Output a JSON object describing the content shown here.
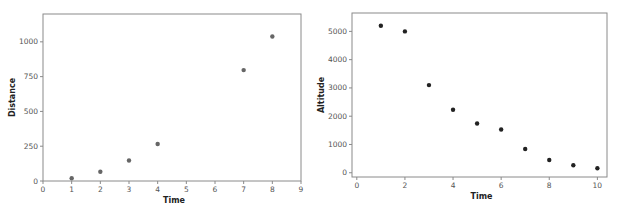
{
  "chart_data": [
    {
      "type": "scatter",
      "title": "",
      "xlabel": "Time",
      "ylabel": "Distance",
      "xlim": [
        0,
        9
      ],
      "ylim": [
        0,
        1200
      ],
      "xticks": [
        0,
        1,
        2,
        3,
        4,
        5,
        6,
        7,
        8,
        9
      ],
      "yticks": [
        0,
        250,
        500,
        750,
        1000
      ],
      "grid": false,
      "marker_color": "#666666",
      "series": [
        {
          "name": "Distance",
          "x": [
            1,
            2,
            3,
            4,
            7,
            8
          ],
          "y": [
            20,
            67,
            147,
            266,
            797,
            1038
          ]
        }
      ]
    },
    {
      "type": "scatter",
      "title": "",
      "xlabel": "Time",
      "ylabel": "Altitude",
      "xlim": [
        -0.2,
        10.4
      ],
      "ylim": [
        -150,
        5650
      ],
      "xticks": [
        0,
        2,
        4,
        6,
        8,
        10
      ],
      "yticks": [
        0,
        1000,
        2000,
        3000,
        4000,
        5000
      ],
      "grid": false,
      "marker_color": "#222222",
      "series": [
        {
          "name": "Altitude",
          "x": [
            1,
            2,
            3,
            4,
            5,
            6,
            7,
            8,
            9,
            10
          ],
          "y": [
            5200,
            5000,
            3100,
            2230,
            1740,
            1530,
            840,
            450,
            265,
            160
          ]
        }
      ]
    }
  ]
}
